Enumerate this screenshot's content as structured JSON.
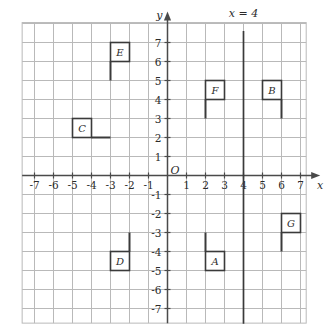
{
  "figure": {
    "title": "",
    "background_color": "#ffffff"
  },
  "chart_data": {
    "type": "scatter",
    "title": "",
    "subtitle": "",
    "xlabel": "x",
    "ylabel": "y",
    "xlim": [
      -7.8,
      7.8
    ],
    "ylim": [
      -7.8,
      7.8
    ],
    "grid": true,
    "grid_step": 1,
    "grid_color": "#b9b9b9",
    "axis_color": "#4a4a4a",
    "legend": "none",
    "origin_label": "O",
    "x_tick_labels": [
      "-7",
      "-6",
      "-5",
      "-4",
      "-3",
      "-2",
      "-1",
      "1",
      "2",
      "3",
      "4",
      "5",
      "6",
      "7"
    ],
    "x_tick_values": [
      -7,
      -6,
      -5,
      -4,
      -3,
      -2,
      -1,
      1,
      2,
      3,
      4,
      5,
      6,
      7
    ],
    "y_tick_labels": [
      "7",
      "6",
      "5",
      "4",
      "3",
      "2",
      "1",
      "-1",
      "-2",
      "-3",
      "-4",
      "-5",
      "-6",
      "-7"
    ],
    "y_tick_values": [
      7,
      6,
      5,
      4,
      3,
      2,
      1,
      -1,
      -2,
      -3,
      -4,
      -5,
      -6,
      -7
    ],
    "annotations": [
      {
        "name": "vertical-line",
        "label": "x = 4",
        "type": "vline",
        "x": 4,
        "y_from": -7.8,
        "y_to": 7.6,
        "color": "#3a3a3a",
        "label_x": 4,
        "label_y": 8.35
      }
    ],
    "flags": [
      {
        "id": "E",
        "label": "E",
        "box": {
          "x_min": -3,
          "x_max": -2,
          "y_min": 6,
          "y_max": 7
        },
        "pole": {
          "x1": -3,
          "y1": 6,
          "x2": -3,
          "y2": 5
        },
        "color": "#3a3a3a"
      },
      {
        "id": "F",
        "label": "F",
        "box": {
          "x_min": 2,
          "x_max": 3,
          "y_min": 4,
          "y_max": 5
        },
        "pole": {
          "x1": 2,
          "y1": 4,
          "x2": 2,
          "y2": 3
        },
        "color": "#3a3a3a"
      },
      {
        "id": "B",
        "label": "B",
        "box": {
          "x_min": 5,
          "x_max": 6,
          "y_min": 4,
          "y_max": 5
        },
        "pole": {
          "x1": 6,
          "y1": 4,
          "x2": 6,
          "y2": 3
        },
        "color": "#3a3a3a"
      },
      {
        "id": "C",
        "label": "C",
        "box": {
          "x_min": -5,
          "x_max": -4,
          "y_min": 2,
          "y_max": 3
        },
        "pole": {
          "x1": -4,
          "y1": 2,
          "x2": -3,
          "y2": 2
        },
        "color": "#3a3a3a"
      },
      {
        "id": "G",
        "label": "G",
        "box": {
          "x_min": 6,
          "x_max": 7,
          "y_min": -3,
          "y_max": -2
        },
        "pole": {
          "x1": 6,
          "y1": -3,
          "x2": 6,
          "y2": -4
        },
        "color": "#3a3a3a"
      },
      {
        "id": "A",
        "label": "A",
        "box": {
          "x_min": 2,
          "x_max": 3,
          "y_min": -5,
          "y_max": -4
        },
        "pole": {
          "x1": 2,
          "y1": -4,
          "x2": 2,
          "y2": -3
        },
        "color": "#3a3a3a"
      },
      {
        "id": "D",
        "label": "D",
        "box": {
          "x_min": -3,
          "x_max": -2,
          "y_min": -5,
          "y_max": -4
        },
        "pole": {
          "x1": -2,
          "y1": -4,
          "x2": -2,
          "y2": -3
        },
        "color": "#3a3a3a"
      }
    ]
  }
}
